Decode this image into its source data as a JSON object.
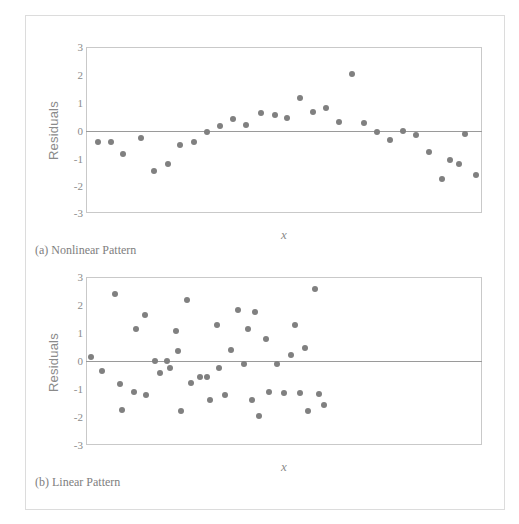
{
  "figure": {
    "width": 519,
    "height": 524,
    "background": "#ffffff",
    "dot_color": "#808080",
    "frame_color": "#c9c9c9",
    "zero_line_color": "#9a9a9a",
    "text_color": "#8a8a8a"
  },
  "panels": {
    "a": {
      "caption": "(a) Nonlinear Pattern",
      "ylabel": "Residuals",
      "xlabel": "x"
    },
    "b": {
      "caption": "(b) Linear Pattern",
      "ylabel": "Residuals",
      "xlabel": "x"
    }
  },
  "yticks": [
    "3",
    "2",
    "1",
    "0",
    "-1",
    "-2",
    "-3"
  ],
  "chart_data": [
    {
      "type": "scatter",
      "title": "(a) Nonlinear Pattern",
      "xlabel": "x",
      "ylabel": "Residuals",
      "ylim": [
        -3,
        3
      ],
      "yticks": [
        3,
        2,
        1,
        0,
        -1,
        -2,
        -3
      ],
      "grid": false,
      "legend": false,
      "annotations": [
        "horizontal reference line at y = 0"
      ],
      "series": [
        {
          "name": "residuals",
          "marker": "filled-circle",
          "color": "#808080",
          "points": [
            [
              0.03,
              -0.45
            ],
            [
              0.063,
              -0.45
            ],
            [
              0.093,
              -0.88
            ],
            [
              0.14,
              -0.28
            ],
            [
              0.172,
              -1.47
            ],
            [
              0.207,
              -1.22
            ],
            [
              0.238,
              -0.55
            ],
            [
              0.272,
              -0.44
            ],
            [
              0.305,
              -0.09
            ],
            [
              0.338,
              0.13
            ],
            [
              0.372,
              0.38
            ],
            [
              0.403,
              0.18
            ],
            [
              0.443,
              0.62
            ],
            [
              0.477,
              0.55
            ],
            [
              0.508,
              0.44
            ],
            [
              0.54,
              1.16
            ],
            [
              0.573,
              0.64
            ],
            [
              0.605,
              0.8
            ],
            [
              0.64,
              0.29
            ],
            [
              0.672,
              2.04
            ],
            [
              0.703,
              0.24
            ],
            [
              0.735,
              -0.09
            ],
            [
              0.768,
              -0.36
            ],
            [
              0.8,
              -0.04
            ],
            [
              0.833,
              -0.19
            ],
            [
              0.865,
              -0.78
            ],
            [
              0.898,
              -1.78
            ],
            [
              0.918,
              -1.08
            ],
            [
              0.943,
              -1.24
            ],
            [
              0.958,
              -0.15
            ],
            [
              0.985,
              -1.62
            ]
          ]
        }
      ]
    },
    {
      "type": "scatter",
      "title": "(b) Linear Pattern",
      "xlabel": "x",
      "ylabel": "Residuals",
      "ylim": [
        -3,
        3
      ],
      "yticks": [
        3,
        2,
        1,
        0,
        -1,
        -2,
        -3
      ],
      "grid": false,
      "legend": false,
      "annotations": [
        "horizontal reference line at y = 0"
      ],
      "series": [
        {
          "name": "residuals",
          "marker": "filled-circle",
          "color": "#808080",
          "points": [
            [
              0.012,
              0.13
            ],
            [
              0.04,
              -0.34
            ],
            [
              0.072,
              2.39
            ],
            [
              0.085,
              -0.82
            ],
            [
              0.09,
              -1.76
            ],
            [
              0.125,
              1.13
            ],
            [
              0.12,
              -1.1
            ],
            [
              0.15,
              1.63
            ],
            [
              0.152,
              -1.22
            ],
            [
              0.175,
              0.0
            ],
            [
              0.187,
              -0.42
            ],
            [
              0.205,
              0.0
            ],
            [
              0.212,
              -0.26
            ],
            [
              0.228,
              1.08
            ],
            [
              0.232,
              0.37
            ],
            [
              0.24,
              -1.77
            ],
            [
              0.255,
              2.19
            ],
            [
              0.265,
              -0.8
            ],
            [
              0.288,
              -0.56
            ],
            [
              0.305,
              -0.56
            ],
            [
              0.312,
              -1.39
            ],
            [
              0.33,
              1.3
            ],
            [
              0.337,
              -0.25
            ],
            [
              0.35,
              -1.22
            ],
            [
              0.365,
              0.41
            ],
            [
              0.385,
              1.82
            ],
            [
              0.4,
              -0.12
            ],
            [
              0.408,
              1.13
            ],
            [
              0.418,
              -1.39
            ],
            [
              0.428,
              1.74
            ],
            [
              0.437,
              -1.97
            ],
            [
              0.455,
              0.79
            ],
            [
              0.462,
              -1.12
            ],
            [
              0.483,
              -0.1
            ],
            [
              0.5,
              -1.15
            ],
            [
              0.518,
              0.22
            ],
            [
              0.528,
              1.27
            ],
            [
              0.54,
              -1.14
            ],
            [
              0.552,
              0.45
            ],
            [
              0.56,
              -1.79
            ],
            [
              0.578,
              2.56
            ],
            [
              0.588,
              -1.18
            ],
            [
              0.6,
              -1.58
            ]
          ]
        }
      ]
    }
  ]
}
